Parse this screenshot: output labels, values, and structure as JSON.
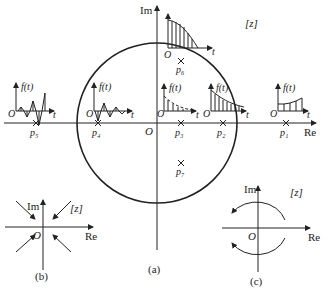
{
  "main": {
    "im_label": "Im",
    "re_label": "Re",
    "plane_label": "[z]",
    "origin_label": "O",
    "caption": "(a)",
    "poles": [
      {
        "id": "p1",
        "label": "p₁",
        "x": 286,
        "y": 123,
        "response": "growing"
      },
      {
        "id": "p2",
        "label": "p₂",
        "x": 223,
        "y": 123,
        "response": "decaying-slow"
      },
      {
        "id": "p3",
        "label": "p₃",
        "x": 181,
        "y": 123,
        "response": "decaying-fast"
      },
      {
        "id": "p4",
        "label": "p₄",
        "x": 98,
        "y": 123,
        "response": "alternating-decaying"
      },
      {
        "id": "p5",
        "label": "p₅",
        "x": 36,
        "y": 123,
        "response": "alternating-growing"
      },
      {
        "id": "p6",
        "label": "p₆",
        "x": 181,
        "y": 60,
        "response": "on-circle"
      },
      {
        "id": "p7",
        "label": "p₇",
        "x": 181,
        "y": 163,
        "response": "complex"
      }
    ],
    "ft_label": "f(t)",
    "t_label": "t"
  },
  "panel_b": {
    "im_label": "Im",
    "re_label": "Re",
    "plane_label": "[z]",
    "origin_label": "O",
    "caption": "(b)"
  },
  "panel_c": {
    "im_label": "Im",
    "re_label": "Re",
    "plane_label": "[z]",
    "origin_label": "O",
    "caption": "(c)"
  }
}
